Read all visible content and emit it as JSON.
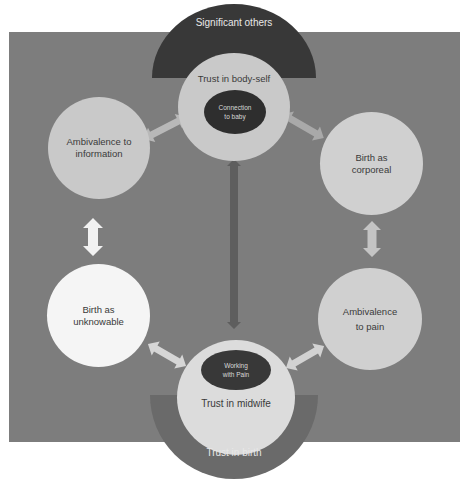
{
  "diagram": {
    "type": "concept-cycle",
    "background_color": "#7d7d7d",
    "top_cluster": {
      "outer_arc": {
        "label": "Significant others",
        "color": "#383838"
      },
      "circle": {
        "label": "Trust in body-self",
        "color": "#c9c9c9"
      },
      "inner_ellipse": {
        "line1": "Connection",
        "line2": "to baby",
        "color": "#2e2e2e"
      }
    },
    "bottom_cluster": {
      "outer_arc": {
        "label": "Trust in birth",
        "color": "#6a6a6a"
      },
      "circle": {
        "label": "Trust in midwife",
        "color": "#dcdcdc"
      },
      "inner_ellipse": {
        "line1": "Working",
        "line2": "with Pain",
        "color": "#383838"
      }
    },
    "nodes": [
      {
        "id": "ambivalence-information",
        "line1": "Ambivalence to",
        "line2": "information",
        "color": "#c9c9c9"
      },
      {
        "id": "birth-unknowable",
        "line1": "Birth as",
        "line2": "unknowable",
        "color": "#f5f5f5"
      },
      {
        "id": "birth-corporeal",
        "line1": "Birth as",
        "line2": "corporeal",
        "color": "#d0d0d0"
      },
      {
        "id": "ambivalence-pain",
        "line1": "Ambivalence",
        "line2": "to pain",
        "color": "#d0d0d0"
      }
    ],
    "arrows": [
      {
        "from": "Trust in body-self",
        "to": "Ambivalence to information",
        "style": "double",
        "color": "#b8b8b8"
      },
      {
        "from": "Trust in body-self",
        "to": "Birth as corporeal",
        "style": "double",
        "color": "#a9a9a9"
      },
      {
        "from": "Ambivalence to information",
        "to": "Birth as unknowable",
        "style": "double",
        "color": "#f2f2f2"
      },
      {
        "from": "Birth as corporeal",
        "to": "Ambivalence to pain",
        "style": "double",
        "color": "#c4c4c4"
      },
      {
        "from": "Birth as unknowable",
        "to": "Trust in midwife",
        "style": "double",
        "color": "#d6d6d6"
      },
      {
        "from": "Ambivalence to pain",
        "to": "Trust in midwife",
        "style": "double",
        "color": "#d2d2d2"
      },
      {
        "from": "Trust in body-self",
        "to": "Trust in midwife",
        "style": "double",
        "color": "#5e5e5e"
      }
    ]
  }
}
